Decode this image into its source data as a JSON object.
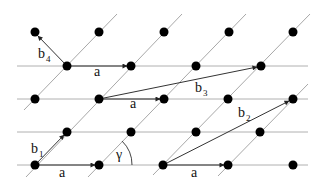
{
  "diagram": {
    "type": "lattice-vectors",
    "colors": {
      "background": "#ffffff",
      "lattice_point": "#000000",
      "horizontal_line": "#b0b0b0",
      "diagonal_line": "#a8a8a8",
      "vector": "#333333"
    },
    "rows": [
      {
        "y": 32,
        "points_x": [
          35,
          99,
          164,
          229,
          293
        ],
        "horizontal_line": false
      },
      {
        "y": 66,
        "points_x": [
          67,
          131,
          196,
          261
        ],
        "horizontal_line": true
      },
      {
        "y": 99,
        "points_x": [
          35,
          99,
          164,
          228,
          293
        ],
        "horizontal_line": true
      },
      {
        "y": 132,
        "points_x": [
          67,
          131,
          196,
          260
        ],
        "horizontal_line": true
      },
      {
        "y": 165,
        "points_x": [
          35,
          99,
          163,
          228,
          293
        ],
        "horizontal_line": true
      }
    ],
    "vectors": [
      {
        "name": "a",
        "from": [
          67,
          66
        ],
        "to": [
          131,
          66
        ],
        "label": "a"
      },
      {
        "name": "a",
        "from": [
          99,
          99
        ],
        "to": [
          164,
          99
        ],
        "label": "a"
      },
      {
        "name": "a",
        "from": [
          35,
          165
        ],
        "to": [
          99,
          165
        ],
        "label": "a"
      },
      {
        "name": "a",
        "from": [
          163,
          165
        ],
        "to": [
          228,
          165
        ],
        "label": "a"
      },
      {
        "name": "b1",
        "from": [
          35,
          165
        ],
        "to": [
          67,
          132
        ],
        "label": "b",
        "subscript": "1"
      },
      {
        "name": "b2",
        "from": [
          163,
          165
        ],
        "to": [
          293,
          99
        ],
        "label": "b",
        "subscript": "2"
      },
      {
        "name": "b3",
        "from": [
          99,
          99
        ],
        "to": [
          261,
          66
        ],
        "label": "b",
        "subscript": "3"
      },
      {
        "name": "b4",
        "from": [
          67,
          66
        ],
        "to": [
          35,
          32
        ],
        "label": "b",
        "subscript": "4"
      }
    ],
    "angle": {
      "label": "γ",
      "vertex": [
        99,
        165
      ],
      "radius": 33
    }
  },
  "labels": {
    "a_top": "a",
    "a_middle": "a",
    "a_bottom_left": "a",
    "a_bottom_right": "a",
    "b1": "b",
    "b1_sub": "1",
    "b2": "b",
    "b2_sub": "2",
    "b3": "b",
    "b3_sub": "3",
    "b4": "b",
    "b4_sub": "4",
    "gamma": "γ"
  }
}
